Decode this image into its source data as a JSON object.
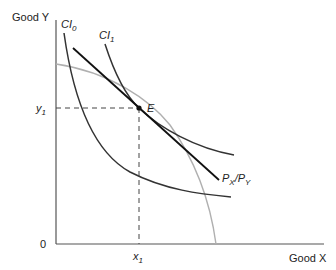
{
  "diagram": {
    "y_axis_label": "Good Y",
    "x_axis_label": "Good X",
    "origin_label": "0",
    "y1_label": "y",
    "y1_sub": "1",
    "x1_label": "x",
    "x1_sub": "1",
    "point_label": "E",
    "ci0_label": "CI",
    "ci0_sub": "0",
    "ci1_label": "CI",
    "ci1_sub": "1",
    "budget_label_p1": "P",
    "budget_label_s1": "X",
    "budget_label_slash": "/P",
    "budget_label_s2": "Y",
    "colors": {
      "axis": "#555555",
      "curve": "#333333",
      "budget_line": "#111111",
      "ppf": "#b0b0b0",
      "dashed": "#444444"
    }
  }
}
